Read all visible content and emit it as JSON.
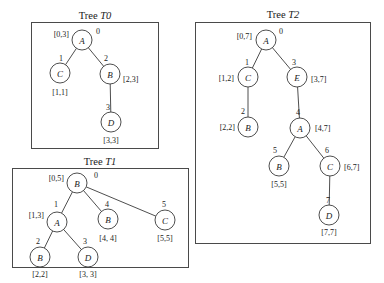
{
  "figure": {
    "background_color": "#ffffff",
    "stroke_color": "#3a3a3a",
    "panels": [
      {
        "id": "tree-t0",
        "title_prefix": "Tree ",
        "title_name": "T0",
        "title_x": 95,
        "title_y": 15,
        "box": {
          "x": 31,
          "y": 22,
          "w": 127,
          "h": 126
        },
        "nodes": [
          {
            "id": "t0-n0",
            "letter": "A",
            "index": "0",
            "range": "[0,3]",
            "cx": 82,
            "cy": 40,
            "r": 10,
            "index_x": 98,
            "index_y": 31,
            "range_x": 69,
            "range_y": 34,
            "range_anchor": "end"
          },
          {
            "id": "t0-n1",
            "letter": "C",
            "index": "1",
            "range": "[1,1]",
            "cx": 60,
            "cy": 73,
            "r": 10,
            "index_x": 61,
            "index_y": 58,
            "range_x": 60,
            "range_y": 92,
            "range_anchor": "mid"
          },
          {
            "id": "t0-n2",
            "letter": "B",
            "index": "2",
            "range": "[2,3]",
            "cx": 110,
            "cy": 74,
            "r": 10,
            "index_x": 106,
            "index_y": 58,
            "range_x": 123,
            "range_y": 79,
            "range_anchor": "start"
          },
          {
            "id": "t0-n3",
            "letter": "D",
            "index": "3",
            "range": "[3,3]",
            "cx": 111,
            "cy": 122,
            "r": 10,
            "index_x": 108,
            "index_y": 107,
            "range_x": 111,
            "range_y": 140,
            "range_anchor": "mid"
          }
        ],
        "edges": [
          {
            "from": "t0-n0",
            "to": "t0-n1"
          },
          {
            "from": "t0-n0",
            "to": "t0-n2"
          },
          {
            "from": "t0-n2",
            "to": "t0-n3"
          }
        ]
      },
      {
        "id": "tree-t1",
        "title_prefix": "Tree ",
        "title_name": "T1",
        "title_x": 100,
        "title_y": 161,
        "box": {
          "x": 12,
          "y": 168,
          "w": 176,
          "h": 99
        },
        "nodes": [
          {
            "id": "t1-n0",
            "letter": "B",
            "index": "0",
            "range": "[0,5]",
            "cx": 77,
            "cy": 183,
            "r": 10,
            "index_x": 96,
            "index_y": 175,
            "range_x": 64,
            "range_y": 178,
            "range_anchor": "end"
          },
          {
            "id": "t1-n1",
            "letter": "A",
            "index": "1",
            "range": "[1,3]",
            "cx": 57,
            "cy": 222,
            "r": 10,
            "index_x": 56,
            "index_y": 204,
            "range_x": 44,
            "range_y": 215,
            "range_anchor": "end"
          },
          {
            "id": "t1-n2",
            "letter": "B",
            "index": "2",
            "range": "[2,2]",
            "cx": 40,
            "cy": 257,
            "r": 10,
            "index_x": 38,
            "index_y": 241,
            "range_x": 40,
            "range_y": 274,
            "range_anchor": "mid"
          },
          {
            "id": "t1-n3",
            "letter": "D",
            "index": "3",
            "range": "[3, 3]",
            "cx": 88,
            "cy": 257,
            "r": 10,
            "index_x": 85,
            "index_y": 241,
            "range_x": 88,
            "range_y": 274,
            "range_anchor": "mid"
          },
          {
            "id": "t1-n4",
            "letter": "B",
            "index": "4",
            "range": "[4, 4]",
            "cx": 108,
            "cy": 219,
            "r": 10,
            "index_x": 107,
            "index_y": 204,
            "range_x": 108,
            "range_y": 238,
            "range_anchor": "mid"
          },
          {
            "id": "t1-n5",
            "letter": "C",
            "index": "5",
            "range": "[5,5]",
            "cx": 165,
            "cy": 220,
            "r": 10,
            "index_x": 164,
            "index_y": 204,
            "range_x": 165,
            "range_y": 238,
            "range_anchor": "mid"
          }
        ],
        "edges": [
          {
            "from": "t1-n0",
            "to": "t1-n1"
          },
          {
            "from": "t1-n0",
            "to": "t1-n4"
          },
          {
            "from": "t1-n0",
            "to": "t1-n5"
          },
          {
            "from": "t1-n1",
            "to": "t1-n2"
          },
          {
            "from": "t1-n1",
            "to": "t1-n3"
          }
        ]
      },
      {
        "id": "tree-t2",
        "title_prefix": "Tree ",
        "title_name": "T2",
        "title_x": 283,
        "title_y": 14,
        "box": {
          "x": 195,
          "y": 22,
          "w": 175,
          "h": 221
        },
        "nodes": [
          {
            "id": "t2-n0",
            "letter": "A",
            "index": "0",
            "range": "[0,7]",
            "cx": 266,
            "cy": 40,
            "r": 10,
            "index_x": 281,
            "index_y": 31,
            "range_x": 252,
            "range_y": 36,
            "range_anchor": "end"
          },
          {
            "id": "t2-n1",
            "letter": "C",
            "index": "1",
            "range": "[1,2]",
            "cx": 248,
            "cy": 77,
            "r": 10,
            "index_x": 247,
            "index_y": 62,
            "range_x": 234,
            "range_y": 78,
            "range_anchor": "end"
          },
          {
            "id": "t2-n2",
            "letter": "B",
            "index": "2",
            "range": "[2,2]",
            "cx": 248,
            "cy": 127,
            "r": 10,
            "index_x": 243,
            "index_y": 111,
            "range_x": 235,
            "range_y": 127,
            "range_anchor": "end"
          },
          {
            "id": "t2-n3",
            "letter": "E",
            "index": "3",
            "range": "[3,7]",
            "cx": 297,
            "cy": 77,
            "r": 10,
            "index_x": 294,
            "index_y": 62,
            "range_x": 311,
            "range_y": 79,
            "range_anchor": "start"
          },
          {
            "id": "t2-n4",
            "letter": "A",
            "index": "4",
            "range": "[4,7]",
            "cx": 300,
            "cy": 128,
            "r": 10,
            "index_x": 298,
            "index_y": 112,
            "range_x": 315,
            "range_y": 128,
            "range_anchor": "start"
          },
          {
            "id": "t2-n5",
            "letter": "B",
            "index": "5",
            "range": "[5,5]",
            "cx": 279,
            "cy": 166,
            "r": 10,
            "index_x": 275,
            "index_y": 150,
            "range_x": 279,
            "range_y": 184,
            "range_anchor": "mid"
          },
          {
            "id": "t2-n6",
            "letter": "C",
            "index": "6",
            "range": "[6,7]",
            "cx": 330,
            "cy": 166,
            "r": 10,
            "index_x": 327,
            "index_y": 150,
            "range_x": 344,
            "range_y": 167,
            "range_anchor": "start"
          },
          {
            "id": "t2-n7",
            "letter": "D",
            "index": "7",
            "range": "[7,7]",
            "cx": 329,
            "cy": 215,
            "r": 10,
            "index_x": 328,
            "index_y": 200,
            "range_x": 329,
            "range_y": 232,
            "range_anchor": "mid"
          }
        ],
        "edges": [
          {
            "from": "t2-n0",
            "to": "t2-n1"
          },
          {
            "from": "t2-n0",
            "to": "t2-n3"
          },
          {
            "from": "t2-n1",
            "to": "t2-n2"
          },
          {
            "from": "t2-n3",
            "to": "t2-n4"
          },
          {
            "from": "t2-n4",
            "to": "t2-n5"
          },
          {
            "from": "t2-n4",
            "to": "t2-n6"
          },
          {
            "from": "t2-n6",
            "to": "t2-n7"
          }
        ]
      }
    ]
  }
}
